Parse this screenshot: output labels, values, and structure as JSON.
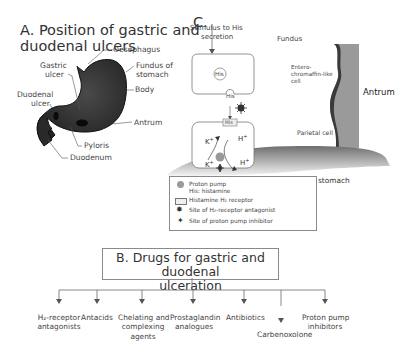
{
  "section_a": {
    "title_line1": "A. Position of gastric and",
    "title_line2": "duodenal  ulcers",
    "labels": {
      "oesophagus": "Oesophagus",
      "fundus_line1": "Fundus of",
      "fundus_line2": "stomach",
      "body": "Body",
      "antrum": "Antrum",
      "gastric_line1": "Gastric",
      "gastric_line2": "ulcer",
      "duodenal_line1": "Duodenal",
      "duodenal_line2": "ulcer",
      "pyloris": "Pyloris",
      "duodenum": "Duodenum"
    }
  },
  "section_c": {
    "title": "C.",
    "stimulus_line1": "Stimulus to His",
    "stimulus_line2": "secretion",
    "fundus": "Fundus",
    "ecl_line1": "Entero-",
    "ecl_line2": "chromaffin-like",
    "ecl_line3": "cell",
    "his_in_cell": "His",
    "his_label": "His",
    "receptor_label": "His",
    "parietal_cell": "Parietal cell",
    "k_plus_top": "K",
    "h_plus_top": "H",
    "k_plus_bottom": "K",
    "h_plus_bottom": "H",
    "plus": "+",
    "antrum": "Antrum",
    "lumen": "Lumen of stomach",
    "legend": [
      {
        "icon": "proton-pump-icon",
        "text": "Proton pump"
      },
      {
        "icon": "none",
        "text": "His: histamine"
      },
      {
        "icon": "receptor-icon",
        "text": "Histamine H₂ receptor"
      },
      {
        "icon": "burst-icon",
        "text": "Site of H₂-receptor antagonist"
      },
      {
        "icon": "star-icon",
        "text": "Site of proton pump inhibitor"
      }
    ]
  },
  "section_b": {
    "title_line1": "B. Drugs for gastric and duodenal",
    "title_line2": "ulceration",
    "drugs": [
      {
        "line1": "H₂-receptor",
        "line2": "antagonists",
        "line3": ""
      },
      {
        "line1": "Antacids",
        "line2": "",
        "line3": ""
      },
      {
        "line1": "Chelating and",
        "line2": "complexing",
        "line3": "agents"
      },
      {
        "line1": "Prostaglandin",
        "line2": "analogues",
        "line3": ""
      },
      {
        "line1": "Antibiotics",
        "line2": "",
        "line3": ""
      },
      {
        "line1": "Carbenoxolone",
        "line2": "",
        "line3": ""
      },
      {
        "line1": "Proton pump",
        "line2": "inhibitors",
        "line3": ""
      }
    ]
  },
  "colors": {
    "stomach": "#2b2b2b",
    "lumen_gray": "#8c8c8c",
    "antrum_gray": "#9a9a9a",
    "line": "#6a6a6a"
  }
}
